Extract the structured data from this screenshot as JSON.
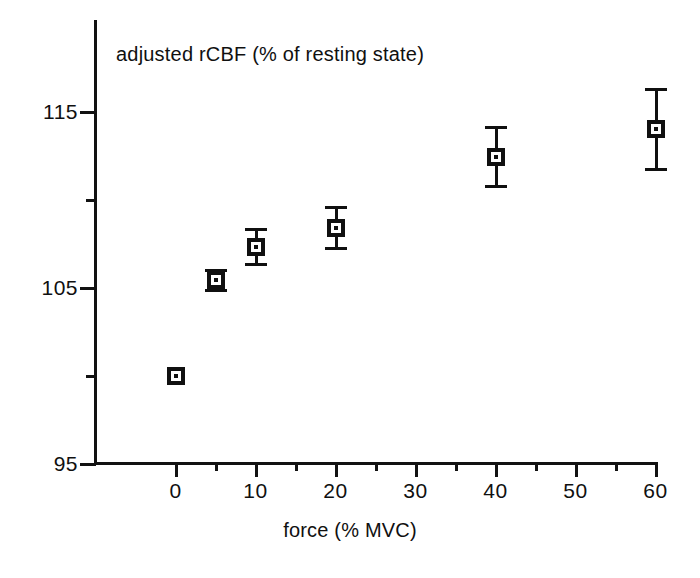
{
  "chart_data": {
    "type": "scatter",
    "title": "adjusted rCBF (% of resting state)",
    "xlabel": "force (% MVC)",
    "ylabel": "",
    "xlim": [
      -2.2,
      60
    ],
    "ylim": [
      95,
      118.5
    ],
    "grid": false,
    "legend": null,
    "x_major_ticks": [
      0,
      10,
      20,
      30,
      40,
      50,
      60
    ],
    "x_minor_ticks": [
      5,
      15,
      25,
      35,
      45,
      55
    ],
    "x_tick_labels": [
      "0",
      "10",
      "20",
      "30",
      "40",
      "50",
      "60"
    ],
    "y_major_ticks": [
      95,
      105,
      115
    ],
    "y_minor_ticks": [
      100,
      110
    ],
    "y_tick_labels": [
      "95",
      "105",
      "115"
    ],
    "marker_style": "open-square-with-center-dot",
    "series": [
      {
        "name": "adjusted rCBF",
        "x": [
          0,
          5,
          10,
          20,
          40,
          60
        ],
        "y": [
          100.0,
          105.4,
          107.3,
          108.4,
          112.4,
          114.0
        ],
        "yerr": [
          0.0,
          0.6,
          1.0,
          1.2,
          1.7,
          2.3
        ]
      }
    ],
    "colors": {
      "marker": "#101010",
      "axis": "#121212",
      "background": "#ffffff"
    }
  }
}
